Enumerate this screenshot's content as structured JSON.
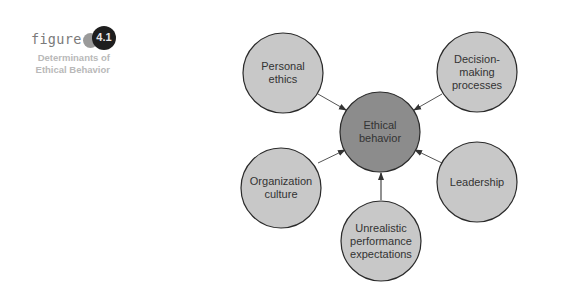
{
  "figure": {
    "word": "figure",
    "number": "4.1",
    "caption_line1": "Determinants of",
    "caption_line2": "Ethical Behavior"
  },
  "colors": {
    "outer_fill": "#c8c8c8",
    "center_fill": "#8c8c8c",
    "stroke": "#2a2a2a",
    "arrow": "#555555"
  },
  "nodes": {
    "center": {
      "line1": "Ethical",
      "line2": "behavior"
    },
    "personal_ethics": {
      "line1": "Personal",
      "line2": "ethics"
    },
    "decision_making": {
      "line1": "Decision-",
      "line2": "making",
      "line3": "processes"
    },
    "leadership": {
      "line1": "Leadership"
    },
    "organization_culture": {
      "line1": "Organization",
      "line2": "culture"
    },
    "unrealistic_expectations": {
      "line1": "Unrealistic",
      "line2": "performance",
      "line3": "expectations"
    }
  }
}
